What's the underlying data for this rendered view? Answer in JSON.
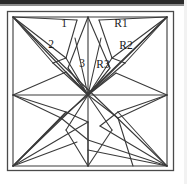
{
  "figure": {
    "background_color": "#ffffff",
    "line_color": "#3a3a3a",
    "frame_color": "#4a4a4a",
    "label_color": "#1a1a1a",
    "canvas": {
      "width": 187,
      "height": 184
    },
    "frame": {
      "x": 7,
      "y": 11,
      "width": 167,
      "height": 160
    },
    "labels": [
      {
        "id": "label-1",
        "text": "1",
        "x": 64,
        "y": 24
      },
      {
        "id": "label-2",
        "text": "2",
        "x": 51,
        "y": 45
      },
      {
        "id": "label-3",
        "text": "3",
        "x": 82,
        "y": 64
      },
      {
        "id": "label-r1",
        "text": "R1",
        "x": 121,
        "y": 24
      },
      {
        "id": "label-r2",
        "text": "R2",
        "x": 126,
        "y": 46
      },
      {
        "id": "label-r3",
        "text": "R3",
        "x": 103,
        "y": 65
      }
    ],
    "vertices": {
      "top_left": [
        13,
        17
      ],
      "top_mid": [
        88,
        17
      ],
      "top_right": [
        167,
        17
      ],
      "mid_left": [
        13,
        95
      ],
      "center": [
        88,
        95
      ],
      "mid_right": [
        167,
        95
      ],
      "bottom_left": [
        13,
        166
      ],
      "bottom_mid": [
        88,
        166
      ],
      "bottom_right": [
        167,
        166
      ]
    }
  }
}
